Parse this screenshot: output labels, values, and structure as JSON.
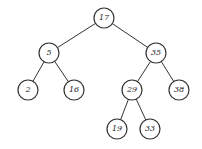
{
  "diagram": {
    "type": "binary-search-tree",
    "node_radius": 10,
    "nodes": [
      {
        "id": "n17",
        "label": "17",
        "x": 104,
        "y": 18
      },
      {
        "id": "n5",
        "label": "5",
        "x": 49,
        "y": 53
      },
      {
        "id": "n35",
        "label": "35",
        "x": 156,
        "y": 53
      },
      {
        "id": "n2",
        "label": "2",
        "x": 28,
        "y": 90
      },
      {
        "id": "n16",
        "label": "16",
        "x": 74,
        "y": 90
      },
      {
        "id": "n29",
        "label": "29",
        "x": 132,
        "y": 90
      },
      {
        "id": "n38",
        "label": "38",
        "x": 179,
        "y": 90
      },
      {
        "id": "n19",
        "label": "19",
        "x": 117,
        "y": 129
      },
      {
        "id": "n33",
        "label": "33",
        "x": 150,
        "y": 129
      }
    ],
    "edges": [
      [
        "n17",
        "n5"
      ],
      [
        "n17",
        "n35"
      ],
      [
        "n5",
        "n2"
      ],
      [
        "n5",
        "n16"
      ],
      [
        "n35",
        "n29"
      ],
      [
        "n35",
        "n38"
      ],
      [
        "n29",
        "n19"
      ],
      [
        "n29",
        "n33"
      ]
    ]
  }
}
